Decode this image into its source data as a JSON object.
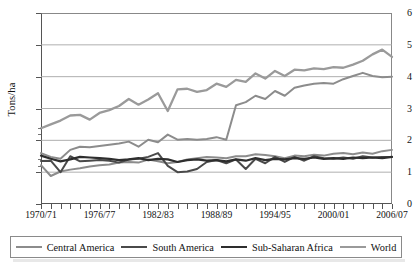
{
  "chart_data": {
    "type": "line",
    "title": "",
    "xlabel": "",
    "ylabel": "Tons/ha",
    "ylim": [
      0,
      6
    ],
    "yticks": [
      0,
      1,
      2,
      3,
      4,
      5,
      6
    ],
    "grid": "horizontal",
    "legend_position": "bottom",
    "x": [
      "1970/71",
      "1971/72",
      "1972/73",
      "1973/74",
      "1974/75",
      "1975/76",
      "1976/77",
      "1977/78",
      "1978/79",
      "1979/80",
      "1980/81",
      "1981/82",
      "1982/83",
      "1983/84",
      "1984/85",
      "1985/86",
      "1986/87",
      "1987/88",
      "1988/89",
      "1989/90",
      "1990/91",
      "1991/92",
      "1992/93",
      "1993/94",
      "1994/95",
      "1995/96",
      "1996/97",
      "1997/98",
      "1998/99",
      "1999/00",
      "2000/01",
      "2001/02",
      "2002/03",
      "2003/04",
      "2004/05",
      "2005/06",
      "2006/07"
    ],
    "xtick_labels": [
      "1970/71",
      "1976/77",
      "1982/83",
      "1988/89",
      "1994/95",
      "2000/01",
      "2006/07"
    ],
    "xtick_indices": [
      0,
      6,
      12,
      18,
      24,
      30,
      36
    ],
    "series": [
      {
        "name": "Central America",
        "color": "#8c8c8c",
        "width": 2.0,
        "values": [
          1.22,
          0.88,
          1.02,
          1.08,
          1.12,
          1.18,
          1.22,
          1.24,
          1.3,
          1.32,
          1.3,
          1.4,
          1.34,
          1.28,
          1.32,
          1.4,
          1.44,
          1.48,
          1.46,
          1.44,
          1.5,
          1.5,
          1.56,
          1.54,
          1.5,
          1.44,
          1.52,
          1.5,
          1.55,
          1.52,
          1.58,
          1.6,
          1.56,
          1.62,
          1.58,
          1.66,
          1.7
        ]
      },
      {
        "name": "South America",
        "color": "#4a4a4a",
        "width": 2.0,
        "values": [
          1.35,
          1.36,
          1.0,
          1.5,
          1.34,
          1.36,
          1.38,
          1.36,
          1.3,
          1.4,
          1.42,
          1.48,
          1.6,
          1.2,
          1.0,
          1.02,
          1.1,
          1.32,
          1.38,
          1.28,
          1.4,
          1.1,
          1.42,
          1.28,
          1.48,
          1.32,
          1.48,
          1.36,
          1.5,
          1.44,
          1.42,
          1.46,
          1.42,
          1.5,
          1.46,
          1.48,
          1.48
        ]
      },
      {
        "name": "Sub-Saharan Africa",
        "color": "#2e2e2e",
        "width": 2.2,
        "values": [
          1.52,
          1.42,
          1.34,
          1.4,
          1.48,
          1.46,
          1.44,
          1.42,
          1.38,
          1.4,
          1.44,
          1.38,
          1.42,
          1.4,
          1.32,
          1.38,
          1.4,
          1.36,
          1.38,
          1.34,
          1.4,
          1.36,
          1.44,
          1.38,
          1.42,
          1.4,
          1.44,
          1.42,
          1.46,
          1.42,
          1.44,
          1.42,
          1.46,
          1.44,
          1.46,
          1.44,
          1.48
        ]
      },
      {
        "name": "World",
        "color": "#9a9a9a",
        "width": 2.3,
        "values": [
          2.38,
          2.5,
          2.62,
          2.78,
          2.8,
          2.65,
          2.86,
          2.95,
          3.08,
          3.3,
          3.12,
          3.28,
          3.48,
          2.92,
          3.6,
          3.62,
          3.52,
          3.58,
          3.78,
          3.68,
          3.9,
          3.84,
          4.1,
          3.94,
          4.18,
          4.02,
          4.22,
          4.2,
          4.26,
          4.24,
          4.3,
          4.28,
          4.38,
          4.5,
          4.7,
          4.85,
          4.62
        ]
      }
    ],
    "lower_band_series": {
      "note": "south-america-lower-track",
      "values": [
        1.22,
        0.88,
        1.02,
        1.08,
        1.12,
        1.18,
        1.22,
        1.24,
        1.3,
        1.32,
        1.3,
        1.4,
        1.34,
        1.28,
        1.32,
        1.4,
        1.44,
        1.48,
        1.46,
        1.44,
        1.5,
        1.5,
        1.56,
        1.54,
        1.5,
        1.44,
        1.52,
        1.5,
        1.55,
        1.52,
        1.58,
        1.6,
        1.56,
        1.62,
        1.58,
        1.66,
        1.7
      ]
    },
    "mid_series": {
      "name": "South America upper band",
      "values": [
        1.6,
        1.48,
        1.42,
        1.7,
        1.8,
        1.78,
        1.82,
        1.86,
        1.9,
        1.96,
        1.8,
        2.02,
        1.94,
        2.18,
        2.02,
        2.04,
        2.02,
        2.04,
        2.1,
        2.02,
        3.1,
        3.2,
        3.4,
        3.3,
        3.55,
        3.4,
        3.65,
        3.72,
        3.78,
        3.8,
        3.78,
        3.92,
        4.02,
        4.12,
        4.02,
        3.98,
        4.0
      ]
    }
  },
  "legend": {
    "items": [
      {
        "label": "Central America"
      },
      {
        "label": "South America"
      },
      {
        "label": "Sub-Saharan Africa"
      },
      {
        "label": "World"
      }
    ]
  }
}
